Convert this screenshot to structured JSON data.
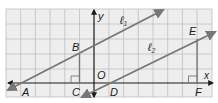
{
  "diagram": {
    "type": "coordinate-geometry",
    "grid": {
      "left": 6,
      "top": 9,
      "right": 212,
      "bottom": 97,
      "cell": 14.7,
      "line_color": "#bfbfbf",
      "fill_color": "#eeeeee"
    },
    "axes": {
      "color": "#1a1a1a",
      "x_axis": {
        "y": 83,
        "label": "x"
      },
      "y_axis": {
        "x": 94,
        "label": "y"
      },
      "origin_label": "O"
    },
    "lines": [
      {
        "name": "l1",
        "label": "ℓ",
        "subscript": "1",
        "color": "#777777"
      },
      {
        "name": "l2",
        "label": "ℓ",
        "subscript": "2",
        "color": "#777777"
      }
    ],
    "points": {
      "A": "A",
      "B": "B",
      "C": "C",
      "D": "D",
      "E": "E",
      "F": "F"
    },
    "segments": [
      "BC",
      "EF"
    ],
    "right_angles": [
      "C",
      "F"
    ]
  }
}
